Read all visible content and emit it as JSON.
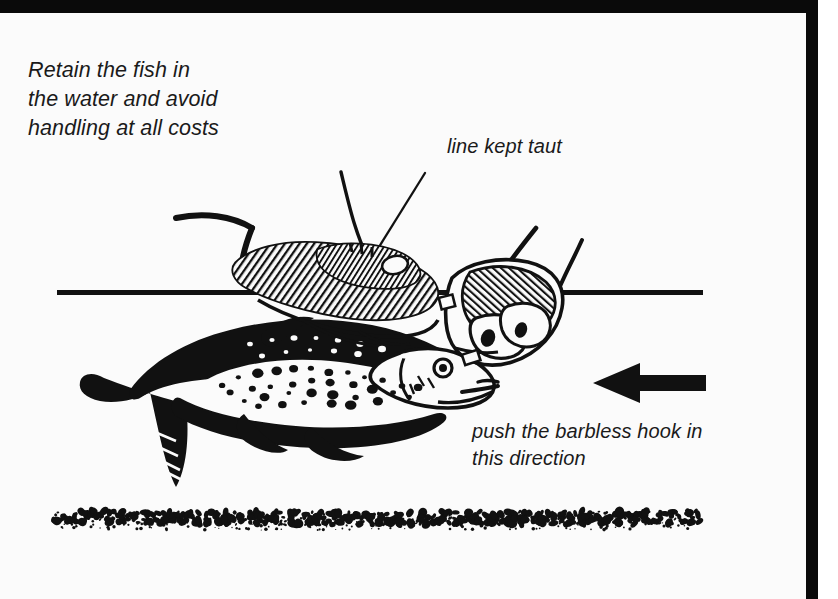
{
  "page": {
    "background_color": "#fbfbfb",
    "border_color": "#0a0a0a",
    "ink_color": "#111111"
  },
  "captions": {
    "retain": "Retain the fish in\nthe water and avoid\nhandling at all costs",
    "line_taut": "line kept taut",
    "push_hook": "push the barbless hook in\nthis direction"
  },
  "illustration": {
    "title": "Angler releasing a spotted trout held in the water while pushing out a barbless hook",
    "style": "black-and-white pen-and-ink woodcut line drawing",
    "elements": [
      "water-surface-line",
      "left-hand-cradling-fish",
      "right-hand-holding-hook",
      "fishing-line",
      "spotted-trout",
      "direction-arrow",
      "gravel-riverbed"
    ],
    "arrow_direction": "left"
  }
}
